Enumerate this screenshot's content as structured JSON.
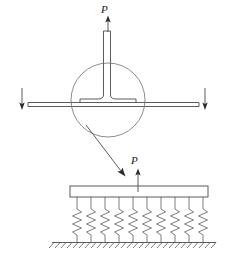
{
  "figure": {
    "type": "engineering-schematic",
    "line_color": "#4a4a4a",
    "label_color": "#1a1a1a",
    "background": "#ffffff",
    "labels": {
      "upper_load": "P",
      "lower_load": "P"
    },
    "geometry": {
      "circle": {
        "cx": 108,
        "cy": 100,
        "r": 37
      },
      "web": {
        "x": 103,
        "y_top": 31,
        "width": 7,
        "y_bottom": 99
      },
      "flange": {
        "x_left": 28,
        "x_right": 199,
        "y": 99,
        "thickness": 4
      },
      "flange_fillet_left": 80,
      "flange_fillet_right": 136,
      "upper_arrow": {
        "x": 108,
        "y_tail": 31,
        "y_head": 17
      },
      "upper_label_pos": {
        "x": 104,
        "y": 13
      },
      "left_marker": {
        "x": 22,
        "y_top": 88,
        "y_head": 110
      },
      "right_marker": {
        "x": 205,
        "y_top": 88,
        "y_head": 110
      },
      "leader": {
        "x1": 88,
        "y1": 127,
        "x2": 124,
        "y2": 174
      },
      "lower_arrow": {
        "x": 138,
        "y_tail": 192,
        "y_head": 170
      },
      "lower_label_pos": {
        "x": 134,
        "y": 164
      },
      "plate": {
        "x": 70,
        "y": 186,
        "width": 138,
        "height": 11
      },
      "springs": {
        "count": 10,
        "x_first": 77,
        "spacing": 14,
        "y_top": 197,
        "y_bottom": 242,
        "width": 9,
        "coils": 6
      },
      "ground": {
        "x_left": 52,
        "x_right": 216,
        "y": 242,
        "hatch_count": 27,
        "hatch_len": 7
      }
    }
  }
}
